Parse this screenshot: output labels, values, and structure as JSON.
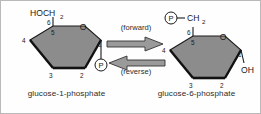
{
  "diagram": {
    "title_absent": true,
    "background_color": "#fefefe",
    "ring_fill_color": "#8c8c8c",
    "ring_stroke_color": "#1a1a1a",
    "text_color": "#1a1a1a"
  },
  "left_molecule": {
    "name": "glucose-1-phosphate",
    "caption": "glucose-1-phosphate",
    "top_group": {
      "text": "HOCH",
      "subscript": "2"
    },
    "ring_oxygen": "O",
    "ring_numbers": [
      "1",
      "2",
      "3",
      "4",
      "5",
      "6"
    ],
    "substituent_c1": "P",
    "phosphate_label": "P",
    "phosphate_position": "C1"
  },
  "right_molecule": {
    "name": "glucose-6-phosphate",
    "caption": "glucose-6-phosphate",
    "top_group": {
      "phosphate": "P",
      "bond": "—",
      "text": "CH",
      "subscript": "2"
    },
    "ring_oxygen": "O",
    "ring_numbers": [
      "1",
      "2",
      "3",
      "4",
      "5",
      "6"
    ],
    "substituent_c1": "OH",
    "phosphate_label": "P",
    "phosphate_position": "C6"
  },
  "arrows": {
    "forward_label": "(forward)",
    "reverse_label": "(reverse)",
    "forward_direction": "right",
    "reverse_direction": "left",
    "style": "hollow-block-arrow",
    "color": "#8c8c8c"
  }
}
